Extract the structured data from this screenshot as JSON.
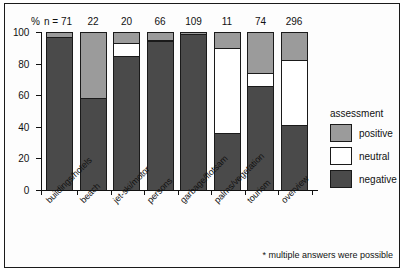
{
  "chart_data": {
    "type": "bar",
    "subtype": "stacked-percentage",
    "title": "",
    "xlabel": "",
    "ylabel": "%",
    "ylim": [
      0,
      100
    ],
    "yticks": [
      0,
      20,
      40,
      60,
      80,
      100
    ],
    "grid": false,
    "legend_position": "right",
    "legend_title": "assessment",
    "categories": [
      "buildings/hotels",
      "beach",
      "jet-ski/motor",
      "persons",
      "garbage/flotsam",
      "palms/vegetation",
      "tourism",
      "overview"
    ],
    "sample_sizes": [
      71,
      22,
      20,
      66,
      109,
      11,
      74,
      296
    ],
    "sample_size_prefix": "n = ",
    "series": [
      {
        "name": "positive",
        "color": "#9b9b9b",
        "values": [
          3,
          42,
          7,
          5,
          1,
          10,
          26,
          18
        ]
      },
      {
        "name": "neutral",
        "color": "#ffffff",
        "values": [
          0,
          0,
          8,
          1,
          0,
          54,
          8,
          41
        ]
      },
      {
        "name": "negative",
        "color": "#4a4a4a",
        "values": [
          97,
          58,
          85,
          94,
          99,
          36,
          66,
          41
        ]
      }
    ],
    "annotations": [
      "* multiple answers were possible"
    ]
  },
  "axis": {
    "y_unit_label": "%",
    "tick_labels": [
      "100",
      "80",
      "60",
      "40",
      "20",
      "0"
    ]
  },
  "legend": {
    "title": "assessment",
    "items": [
      {
        "label": "positive",
        "color": "#9b9b9b"
      },
      {
        "label": "neutral",
        "color": "#ffffff"
      },
      {
        "label": "negative",
        "color": "#4a4a4a"
      }
    ]
  },
  "footnote": "* multiple answers were possible"
}
